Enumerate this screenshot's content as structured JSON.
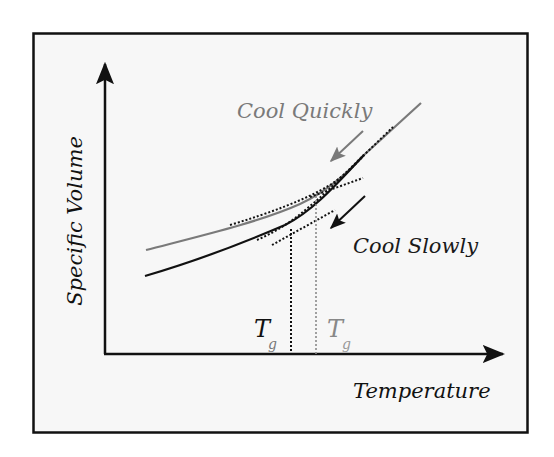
{
  "figure": {
    "y_axis_label": "Specific Volume",
    "x_axis_label": "Temperature",
    "curves": [
      {
        "label": "Cool Quickly",
        "color": "#7a7a7a",
        "tg_label": "T",
        "tg_sub": "g"
      },
      {
        "label": "Cool Slowly",
        "color": "#111111",
        "tg_label": "T",
        "tg_sub": "g"
      }
    ],
    "colors": {
      "background": "#f7f7f7",
      "frame": "#111111",
      "quick": "#7a7a7a",
      "slow": "#111111"
    }
  }
}
